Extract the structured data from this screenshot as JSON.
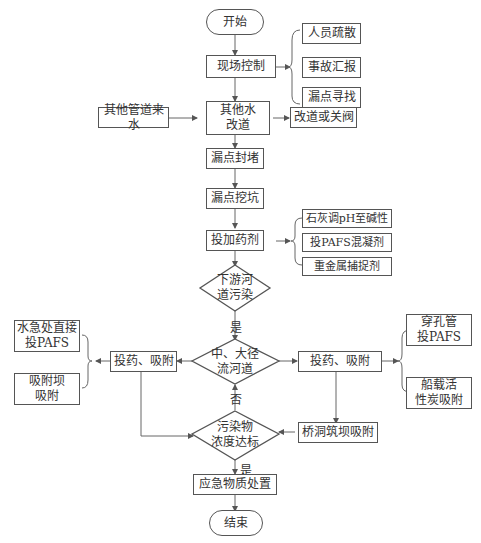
{
  "flowchart": {
    "start": "开始",
    "end": "结束",
    "site_control": "现场控制",
    "site_control_actions": [
      "人员疏散",
      "事故汇报",
      "漏点寻找"
    ],
    "other_water": "其他水\n改道",
    "other_pipe_inflow": "其他管道来水",
    "reroute_or_close": "改道或关阀",
    "leak_seal": "漏点封堵",
    "leak_dig": "漏点挖坑",
    "dosing": "投加药剂",
    "dosing_options": [
      "石灰调pH至碱性",
      "投PAFS混凝剂",
      "重金属捕捉剂"
    ],
    "downstream_decision": "下游河\n道污染",
    "yes_label_1": "是",
    "river_decision": "中、大径\n流河道",
    "left_adsorb": "投药、吸附",
    "left_options": [
      "水急处直接\n投PAFS",
      "吸附坝\n吸附"
    ],
    "right_adsorb": "投药、吸附",
    "right_options": [
      "穿孔管\n投PAFS",
      "船载活\n性炭吸附"
    ],
    "bridge_dam": "桥洞筑坝吸附",
    "no_label": "否",
    "concentration_decision": "污染物\n浓度达标",
    "yes_label_2": "是",
    "emergency_disposal": "应急物质处置"
  },
  "colors": {
    "line": "#555555",
    "text": "#333333",
    "background": "#ffffff"
  }
}
